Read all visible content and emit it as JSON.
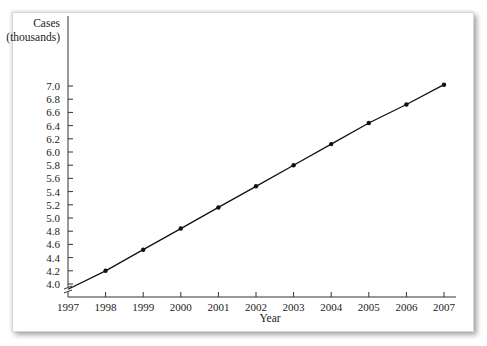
{
  "chart_data": {
    "type": "line",
    "title": "",
    "xlabel": "Year",
    "ylabel": "Cases (thousands)",
    "ylabel_lines": [
      "Cases",
      "(thousands)"
    ],
    "x": [
      1998,
      1999,
      2000,
      2001,
      2002,
      2003,
      2004,
      2005,
      2006,
      2007
    ],
    "series": [
      {
        "name": "Cases",
        "values": [
          4.2,
          4.52,
          4.84,
          5.16,
          5.48,
          5.8,
          6.12,
          6.44,
          6.72,
          7.02
        ],
        "line_start": {
          "x": 1997,
          "y": 3.92
        },
        "markers": true
      }
    ],
    "x_ticks": [
      "1997",
      "1998",
      "1999",
      "2000",
      "2001",
      "2002",
      "2003",
      "2004",
      "2005",
      "2006",
      "2007"
    ],
    "y_ticks": [
      "4.0",
      "4.2",
      "4.4",
      "4.6",
      "4.8",
      "5.0",
      "5.2",
      "5.4",
      "5.6",
      "5.8",
      "6.0",
      "6.2",
      "6.4",
      "6.6",
      "6.8",
      "7.0"
    ],
    "xlim": [
      1997,
      2007
    ],
    "ylim": [
      3.85,
      7.0
    ],
    "y_axis_break": true,
    "grid": false,
    "legend": "none",
    "colors": {
      "line": "#111111",
      "axis": "#333333",
      "text": "#222222"
    }
  }
}
